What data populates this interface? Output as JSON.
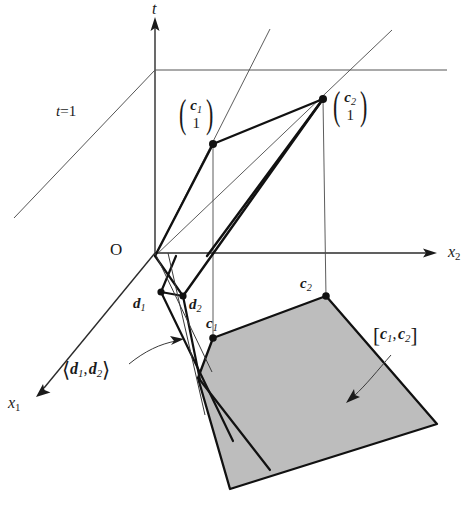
{
  "figure": {
    "type": "geometric-diagram",
    "axes": [
      {
        "name": "t-axis",
        "label": "t",
        "label_pos": [
          152,
          4
        ],
        "direction": "up"
      },
      {
        "name": "x2-axis",
        "label": "x",
        "sub": "2",
        "label_pos": [
          448,
          246
        ],
        "direction": "right"
      },
      {
        "name": "x1-axis",
        "label": "x",
        "sub": "1",
        "label_pos": [
          10,
          399
        ],
        "direction": "down-left"
      }
    ],
    "origin_label": "O",
    "hyperplane_label_t": "t",
    "hyperplane_label_eq": "=1",
    "points": [
      {
        "name": "c1-top",
        "vec": "c",
        "sub": "1",
        "second": "1",
        "px": [
          213,
          144
        ]
      },
      {
        "name": "c2-top",
        "vec": "c",
        "sub": "2",
        "second": "1",
        "px": [
          323,
          99
        ]
      },
      {
        "name": "d1",
        "label": "d",
        "sub": "1",
        "px": [
          161,
          292
        ]
      },
      {
        "name": "d2",
        "label": "d",
        "sub": "2",
        "px": [
          183,
          296
        ]
      },
      {
        "name": "c1-base",
        "label": "c",
        "sub": "1",
        "px": [
          213,
          338
        ]
      },
      {
        "name": "c2-base",
        "label": "c",
        "sub": "2",
        "px": [
          326,
          296
        ]
      }
    ],
    "labels": {
      "cone": {
        "open": "⟨",
        "a": "d",
        "a_sub": "1",
        "comma": ",",
        "b": "d",
        "b_sub": "2",
        "close": "⟩"
      },
      "segment": {
        "open": "[",
        "a": "c",
        "a_sub": "1",
        "comma": ",",
        "b": "c",
        "b_sub": "2",
        "close": "]"
      }
    },
    "colors": {
      "ink": "#1a1a1a",
      "thin_line": "#3a3a3a",
      "shade_fill": "#bdbdbd",
      "shade_edge": "#111111",
      "background": "#ffffff"
    }
  }
}
